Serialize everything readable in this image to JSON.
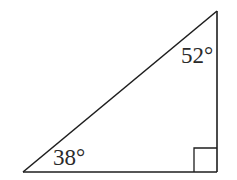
{
  "diagram": {
    "type": "right-triangle",
    "stroke_color": "#1e1e1e",
    "label_color": "#2a2a2a",
    "vertices": {
      "bottom_left": [
        23,
        172
      ],
      "bottom_right": [
        217,
        172
      ],
      "top_right": [
        217,
        11
      ]
    },
    "right_angle_marker": {
      "vertex": "bottom_right",
      "size": 23
    },
    "angles": [
      {
        "vertex": "top_right",
        "label": "52°",
        "value": 52
      },
      {
        "vertex": "bottom_left",
        "label": "38°",
        "value": 38
      },
      {
        "vertex": "bottom_right",
        "label": "",
        "value": 90
      }
    ]
  }
}
